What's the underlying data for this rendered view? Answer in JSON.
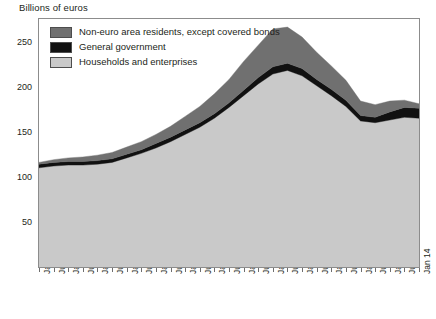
{
  "chart_data": {
    "type": "area",
    "stacked": true,
    "title": "",
    "ylabel": "Billions of euros",
    "xlabel": "",
    "ylim": [
      0,
      275
    ],
    "yticks": [
      50,
      100,
      150,
      200,
      250
    ],
    "grid": false,
    "legend_position": "top-left",
    "x": [
      "Jan 01",
      "Jul 01",
      "Jan 02",
      "Jul 02",
      "Jan 03",
      "Jul 03",
      "Jan 04",
      "Jul 04",
      "Jan 05",
      "Jul 05",
      "Jan 06",
      "Jul 06",
      "Jan 07",
      "Jul 07",
      "Jan 08",
      "Jul 08",
      "Jan 09",
      "Jul 09",
      "Jan 10",
      "Jul 10",
      "Jan 11",
      "Jul 11",
      "Jan 12",
      "Jul 12",
      "Jan 13",
      "Jul 13",
      "Jan 14"
    ],
    "xticklabels": [
      "Jan 01",
      "Jul 01",
      "Jan 02",
      "Jul 02",
      "Jan 03",
      "Jul 03",
      "Jan 04",
      "Jul 04",
      "Jan 05",
      "Jul 05",
      "Jan 06",
      "Jul 06",
      "Jan 07",
      "Jul 07",
      "Jan 08",
      "Jul 08",
      "Jan 09",
      "Jul 09",
      "Jan 10",
      "Jul 10",
      "Jan 11",
      "Jul 11",
      "Jan 12",
      "Jul 12",
      "Jan 13",
      "Jul 13",
      "Jan 14"
    ],
    "series": [
      {
        "name": "Households and enterprises",
        "color": "#c9c9c9",
        "values": [
          110,
          112,
          113,
          113,
          114,
          116,
          121,
          126,
          132,
          139,
          147,
          155,
          165,
          177,
          190,
          203,
          214,
          218,
          212,
          201,
          190,
          178,
          162,
          160,
          163,
          166,
          165
        ]
      },
      {
        "name": "General government",
        "color": "#111111",
        "values": [
          4,
          4,
          4,
          4,
          4,
          4,
          4,
          4,
          5,
          5,
          5,
          5,
          5,
          5,
          6,
          7,
          8,
          8,
          8,
          7,
          7,
          7,
          6,
          6,
          9,
          11,
          11
        ]
      },
      {
        "name": "Non-euro area residents, except covered bonds",
        "color": "#707070",
        "values": [
          2,
          3,
          4,
          5,
          6,
          7,
          8,
          9,
          10,
          12,
          15,
          18,
          22,
          26,
          32,
          36,
          42,
          40,
          35,
          30,
          26,
          22,
          16,
          14,
          12,
          8,
          5
        ]
      }
    ],
    "totals": [
      116,
      119,
      121,
      122,
      124,
      127,
      133,
      139,
      147,
      156,
      167,
      178,
      192,
      208,
      228,
      246,
      264,
      266,
      255,
      238,
      223,
      207,
      184,
      180,
      184,
      185,
      181
    ],
    "legend": [
      {
        "label": "Non-euro area residents, except covered bonds",
        "color": "#707070"
      },
      {
        "label": "General government",
        "color": "#111111"
      },
      {
        "label": "Households and enterprises",
        "color": "#c9c9c9"
      }
    ]
  }
}
